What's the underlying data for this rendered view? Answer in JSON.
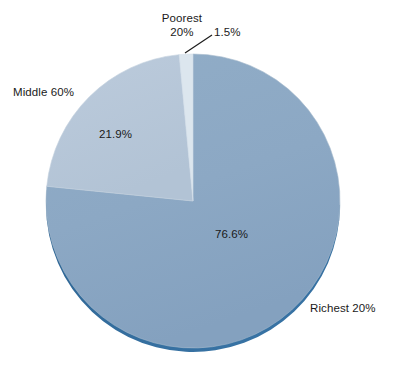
{
  "chart_data": {
    "type": "pie",
    "title": "",
    "subtitle": "",
    "xlabel": "",
    "ylabel": "",
    "grid": false,
    "legend_position": "none",
    "units": "percent",
    "total": 100.0,
    "categories": [
      "Poorest 20%",
      "Middle 60%",
      "Richest 20%"
    ],
    "values": [
      1.5,
      21.9,
      76.6
    ],
    "value_labels": [
      "1.5%",
      "21.9%",
      "76.6%"
    ],
    "start_angle_deg": 0,
    "direction": "clockwise",
    "slices": [
      {
        "name": "Richest 20%",
        "label": "Richest 20%",
        "value": 76.6,
        "value_label": "76.6%",
        "color": "#8ca8c4",
        "start_deg": 0,
        "end_deg": 275.76,
        "callout": "outside-right",
        "leader_line": false
      },
      {
        "name": "Middle 60%",
        "label": "Middle 60%",
        "value": 21.9,
        "value_label": "21.9%",
        "color": "#b6c6d8",
        "start_deg": 275.76,
        "end_deg": 354.6,
        "callout": "outside-left",
        "leader_line": false
      },
      {
        "name": "Poorest 20%",
        "label": "Poorest 20%",
        "value": 1.5,
        "value_label": "1.5%",
        "color": "#dce6ee",
        "start_deg": 354.6,
        "end_deg": 360,
        "callout": "outside-top",
        "leader_line": true
      }
    ],
    "geometry": {
      "center_x": 193,
      "center_y": 201,
      "radius": 147,
      "rim_color": "#2f6b99",
      "outline_color": "#9fb4c9",
      "background": "#ffffff"
    }
  },
  "labels": {
    "poorest_line1": "Poorest",
    "poorest_line2": "20%",
    "poorest_value": "1.5%",
    "middle": "Middle 60%",
    "middle_value": "21.9%",
    "richest": "Richest 20%",
    "richest_value": "76.6%"
  }
}
